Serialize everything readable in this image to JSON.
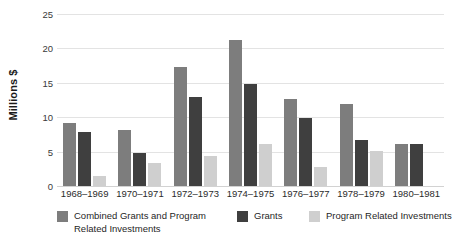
{
  "chart_data": {
    "type": "bar",
    "title": "",
    "xlabel": "",
    "ylabel": "Millions $",
    "ylim": [
      0,
      25
    ],
    "yticks": [
      0,
      5,
      10,
      15,
      20,
      25
    ],
    "grid": true,
    "legend_position": "bottom",
    "categories": [
      "1968–1969",
      "1970–1971",
      "1972–1973",
      "1974–1975",
      "1976–1977",
      "1978–1979",
      "1980–1981"
    ],
    "series": [
      {
        "name": "Combined Grants and Program Related Investments",
        "color": "#7d7d7d",
        "values": [
          9.2,
          8.2,
          17.3,
          21.2,
          12.6,
          11.9,
          6.1
        ]
      },
      {
        "name": "Grants",
        "color": "#3f3f3f",
        "values": [
          7.8,
          4.8,
          13.0,
          14.9,
          9.9,
          6.7,
          6.1
        ]
      },
      {
        "name": "Program Related Investments",
        "color": "#cfcfcf",
        "values": [
          1.4,
          3.4,
          4.3,
          6.1,
          2.8,
          5.1,
          0.0
        ]
      }
    ]
  },
  "axis": {
    "y_title": "Millions $",
    "y_tick_labels": [
      "0",
      "5",
      "10",
      "15",
      "20",
      "25"
    ]
  },
  "legend": {
    "items": [
      {
        "label_line1": "Combined Grants and Program",
        "label_line2": "Related Investments",
        "color": "#7d7d7d"
      },
      {
        "label_line1": "Grants",
        "label_line2": "",
        "color": "#3f3f3f"
      },
      {
        "label_line1": "Program Related Investments",
        "label_line2": "",
        "color": "#cfcfcf"
      }
    ]
  },
  "colors": {
    "grid": "#e3e3e3",
    "background": "#ffffff",
    "text": "#1f1f1f"
  }
}
